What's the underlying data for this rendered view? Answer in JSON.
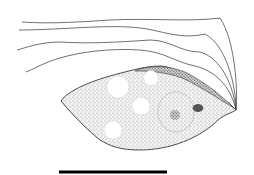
{
  "figure": {
    "colors": {
      "background": "#ffffff",
      "ink": "#1a1a1a",
      "stipple": "#555555",
      "vacuole": "#ffffff"
    },
    "flagella_count": 4,
    "vacuole_count": 4,
    "scale_bar": {
      "x1": 59,
      "x2": 167,
      "y": 172,
      "label": ""
    }
  }
}
